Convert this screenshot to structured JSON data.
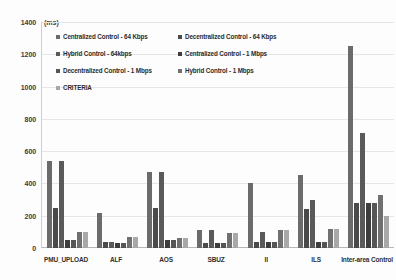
{
  "chart_data": {
    "type": "bar",
    "title": "",
    "subtitle": "",
    "xlabel": "",
    "ylabel": "",
    "unit_label": "(ms)",
    "ylim": [
      0,
      1400
    ],
    "ytick_step": 200,
    "yticks": [
      "1400",
      "1200",
      "1000",
      "800",
      "600",
      "400",
      "200",
      "0"
    ],
    "ytick_values": [
      1400,
      1200,
      1000,
      800,
      600,
      400,
      200,
      0
    ],
    "grid": true,
    "grid_axis": "y",
    "legend_position": "top-inside",
    "categories": [
      "PMU_UPLOAD",
      "ALF",
      "AOS",
      "SBUZ",
      "II",
      "ILS",
      "Inter-area Control"
    ],
    "series": [
      {
        "name": "Centralized Control - 64 Kbps",
        "color": "#6b6b6b",
        "values": [
          540,
          220,
          470,
          110,
          400,
          450,
          1250
        ]
      },
      {
        "name": "Decentralized Control - 64 Kbps",
        "color": "#4a4a4a",
        "values": [
          250,
          40,
          250,
          30,
          40,
          240,
          280
        ]
      },
      {
        "name": "Hybrid Control - 64kbps",
        "color": "#5a5a5a",
        "values": [
          540,
          40,
          470,
          110,
          100,
          300,
          710
        ]
      },
      {
        "name": "Centralized Control - 1 Mbps",
        "color": "#3d3d3d",
        "values": [
          50,
          30,
          50,
          30,
          40,
          40,
          280
        ]
      },
      {
        "name": "Decentralized Control - 1 Mbps",
        "color": "#555555",
        "values": [
          50,
          30,
          50,
          30,
          40,
          40,
          280
        ]
      },
      {
        "name": "Hybrid Control - 1 Mbps",
        "color": "#707070",
        "values": [
          100,
          70,
          60,
          90,
          110,
          120,
          330
        ]
      },
      {
        "name": "CRITERIA",
        "color": "#a8a8a8",
        "values": [
          100,
          70,
          60,
          90,
          110,
          120,
          200
        ]
      }
    ]
  }
}
